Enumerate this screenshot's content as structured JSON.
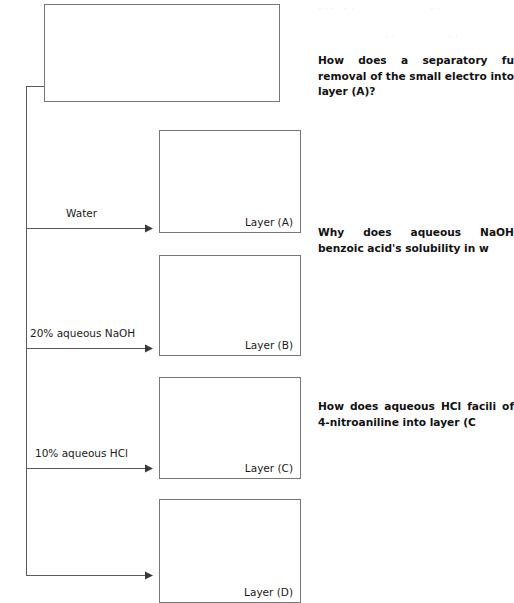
{
  "diagram": {
    "title_box": {
      "name": "unknown-mixture-box",
      "label": ""
    },
    "layers": [
      {
        "id": "a",
        "label": "Layer (A)",
        "reagent": "Water"
      },
      {
        "id": "b",
        "label": "Layer (B)",
        "reagent": "20% aqueous NaOH"
      },
      {
        "id": "c",
        "label": "Layer (C)",
        "reagent": "10% aqueous HCl"
      },
      {
        "id": "d",
        "label": "Layer (D)",
        "reagent": ""
      }
    ]
  },
  "questions": [
    {
      "id": "q1",
      "text": "How does a separatory fu removal of the small electro into layer (A)?"
    },
    {
      "id": "q2",
      "text": "Why does aqueous NaOH benzoic acid's solubility in w"
    },
    {
      "id": "q3",
      "text": "How does aqueous HCl facili of 4-nitroaniline into layer (C"
    }
  ],
  "artifacts": {
    "ghost_1": "··· ··",
    "ghost_2": "··",
    "ghost_3": "··",
    "ghost_4": "··"
  },
  "colors": {
    "box_border": "#777777",
    "connector": "#5a5a5a",
    "arrow_head": "#3a3a3a",
    "text": "#1a1a1a",
    "background": "#ffffff"
  }
}
